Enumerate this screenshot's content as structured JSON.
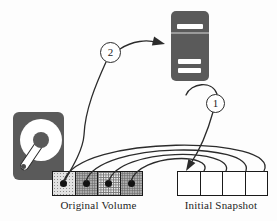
{
  "diagram": {
    "type": "storage-snapshot-diagram",
    "badges": {
      "step1": "1",
      "step2": "2"
    },
    "original_volume": {
      "label": "Original Volume",
      "blocks": [
        {
          "pattern": "light-stipple",
          "dot": true
        },
        {
          "pattern": "medium-stipple",
          "dot": true
        },
        {
          "pattern": "cross-hatch",
          "dot": true
        },
        {
          "pattern": "medium-stipple",
          "dot": true
        }
      ]
    },
    "initial_snapshot": {
      "label": "Initial Snapshot",
      "blocks": [
        {
          "pattern": "empty",
          "dot": false
        },
        {
          "pattern": "empty",
          "dot": false
        },
        {
          "pattern": "empty",
          "dot": false
        },
        {
          "pattern": "empty",
          "dot": false
        }
      ]
    },
    "icons": [
      {
        "name": "hard-disk-icon"
      },
      {
        "name": "server-icon"
      }
    ],
    "colors": {
      "icon_gray": "#5a5a5a",
      "line": "#2b2b2b",
      "block_light": "#e2e2e2",
      "block_medium": "#b3b3b3",
      "snapshot_fill": "#ffffff"
    }
  }
}
